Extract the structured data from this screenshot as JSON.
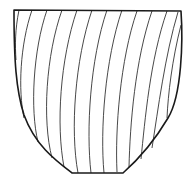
{
  "figure": {
    "colors": {
      "background": "#ffffff",
      "outline": "#1a1a1a",
      "hatch": "#333333"
    },
    "outline_path": "M14,10 L181,11 C183,40 182,95 168,118 C155,140 140,158 123,173 L72,173 C55,160 35,145 24,115 C16,90 14,60 14,10 Z",
    "hatch_paths": [
      "M19,10 C15,30 15,45 16,60",
      "M32,10 C20,45 18,90 24,118",
      "M47,10 C33,50 30,110 38,142",
      "M62,10 C46,55 42,120 52,158",
      "M77,10 C60,60 56,125 64,167",
      "M92,10 C75,60 70,130 78,173",
      "M107,10 C90,60 86,130 91,173",
      "M122,10 C105,60 100,130 104,173",
      "M137,11 C120,60 115,130 117,172",
      "M152,11 C135,60 130,125 129,167",
      "M167,11 C150,60 145,120 141,159",
      "M178,12 C165,55 158,110 152,148",
      "M181,25 C172,60 168,95 167,118"
    ]
  }
}
